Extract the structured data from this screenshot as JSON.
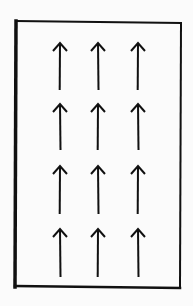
{
  "diagram": {
    "title": "",
    "box": {
      "left": 16,
      "top": 21,
      "right": 181,
      "bottom": 287,
      "stroke": "#111111"
    },
    "arrow_color": "#111111",
    "grid": {
      "rows": 4,
      "cols": 3
    },
    "columns_x": [
      60,
      98,
      138
    ],
    "rows_y": [
      {
        "top": 43,
        "bottom": 90
      },
      {
        "top": 104,
        "bottom": 150
      },
      {
        "top": 166,
        "bottom": 214
      },
      {
        "top": 229,
        "bottom": 277
      }
    ],
    "arrow_direction": "up"
  }
}
